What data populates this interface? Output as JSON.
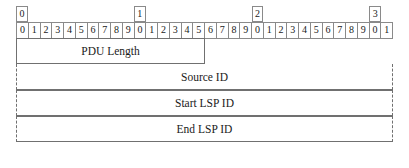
{
  "diagram": {
    "kind": "packet-format-diagram",
    "bit_width": 32,
    "decade_labels": [
      "0",
      "1",
      "2",
      "3"
    ],
    "bit_labels": [
      "0",
      "1",
      "2",
      "3",
      "4",
      "5",
      "6",
      "7",
      "8",
      "9",
      "0",
      "1",
      "2",
      "3",
      "4",
      "5",
      "6",
      "7",
      "8",
      "9",
      "0",
      "1",
      "2",
      "3",
      "4",
      "5",
      "6",
      "7",
      "8",
      "9",
      "0",
      "1"
    ],
    "fields": [
      {
        "label": "PDU Length",
        "span": "half",
        "sides": "solid"
      },
      {
        "label": "Source ID",
        "span": "full",
        "sides": "dashed"
      },
      {
        "label": "Start LSP ID",
        "span": "full",
        "sides": "dashed"
      },
      {
        "label": "End LSP ID",
        "span": "full",
        "sides": "dashed"
      }
    ],
    "colors": {
      "border": "#8a8a8a",
      "field_border": "#707070",
      "text": "#1a1a1a",
      "background": "#ffffff"
    }
  }
}
